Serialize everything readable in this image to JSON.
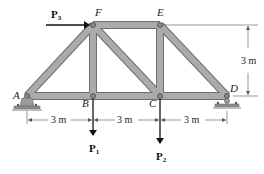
{
  "figure": {
    "type": "truss",
    "colors": {
      "member_fill": "#a9a9a9",
      "member_edge": "#6f6f6f",
      "pin": "#8a8a8a",
      "support": "#9a9a9a",
      "arrow": "#111111",
      "dim_line": "#555555"
    },
    "nodes": {
      "A": {
        "label": "A"
      },
      "B": {
        "label": "B"
      },
      "C": {
        "label": "C"
      },
      "D": {
        "label": "D"
      },
      "E": {
        "label": "E"
      },
      "F": {
        "label": "F"
      }
    },
    "members": [
      "AB",
      "BC",
      "CD",
      "AF",
      "FE",
      "ED",
      "FB",
      "FC",
      "EC"
    ],
    "supports": [
      {
        "node": "A",
        "type": "pin"
      },
      {
        "node": "D",
        "type": "roller"
      }
    ],
    "loads": [
      {
        "name": "P",
        "sub": "3",
        "node": "F",
        "direction": "right"
      },
      {
        "name": "P",
        "sub": "1",
        "node": "B",
        "direction": "down"
      },
      {
        "name": "P",
        "sub": "2",
        "node": "C",
        "direction": "down"
      }
    ],
    "dimensions": {
      "span_AB": "3 m",
      "span_BC": "3 m",
      "span_CD": "3 m",
      "height": "3 m"
    }
  }
}
